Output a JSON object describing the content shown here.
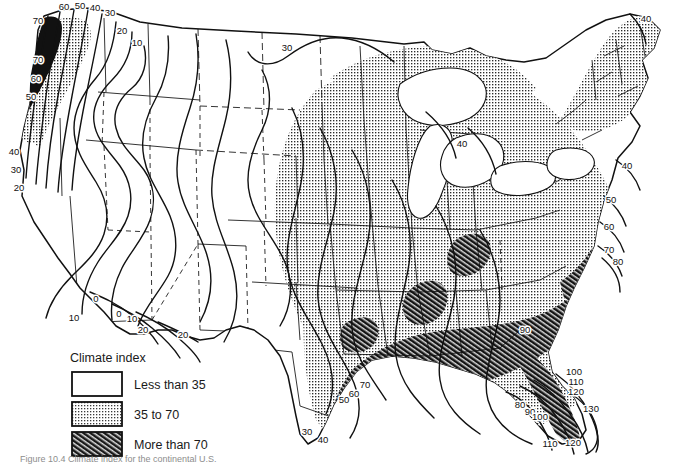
{
  "figure": {
    "kind": "contour-map",
    "region": "Contiguous United States",
    "background_color": "#ffffff",
    "line_color": "#111111",
    "caption": "Figure 10.4  Climate index for the continental U.S."
  },
  "legend": {
    "title": "Climate index",
    "items": [
      {
        "label": "Less than 35",
        "pattern": "blank",
        "swatch_name": "legend-swatch-blank"
      },
      {
        "label": "35 to 70",
        "pattern": "stipple",
        "swatch_name": "legend-swatch-stipple"
      },
      {
        "label": "More than 70",
        "pattern": "hatch",
        "swatch_name": "legend-swatch-hatch"
      }
    ]
  },
  "chart_data": {
    "type": "contour-map",
    "title": "Climate index",
    "units": "index",
    "classes": [
      {
        "name": "Less than 35",
        "range": [
          null,
          35
        ],
        "fill": "blank"
      },
      {
        "name": "35 to 70",
        "range": [
          35,
          70
        ],
        "fill": "stipple"
      },
      {
        "name": "More than 70",
        "range": [
          70,
          null
        ],
        "fill": "hatch"
      }
    ],
    "contour_interval": 10,
    "contour_levels": [
      0,
      10,
      20,
      30,
      40,
      50,
      60,
      70,
      80,
      90,
      100,
      110,
      120,
      130
    ],
    "contour_labels": [
      {
        "value": "70",
        "x": 38,
        "y": 24
      },
      {
        "value": "60",
        "x": 64,
        "y": 10
      },
      {
        "value": "50",
        "x": 80,
        "y": 9
      },
      {
        "value": "40",
        "x": 95,
        "y": 11
      },
      {
        "value": "30",
        "x": 110,
        "y": 16
      },
      {
        "value": "20",
        "x": 122,
        "y": 34
      },
      {
        "value": "10",
        "x": 137,
        "y": 46
      },
      {
        "value": "70",
        "x": 38,
        "y": 63
      },
      {
        "value": "60",
        "x": 36,
        "y": 82
      },
      {
        "value": "50",
        "x": 31,
        "y": 100
      },
      {
        "value": "40",
        "x": 14,
        "y": 155
      },
      {
        "value": "30",
        "x": 16,
        "y": 173
      },
      {
        "value": "20",
        "x": 19,
        "y": 191
      },
      {
        "value": "10",
        "x": 74,
        "y": 321
      },
      {
        "value": "0",
        "x": 96,
        "y": 302
      },
      {
        "value": "0",
        "x": 119,
        "y": 317
      },
      {
        "value": "10",
        "x": 132,
        "y": 322
      },
      {
        "value": "20",
        "x": 143,
        "y": 333
      },
      {
        "value": "20",
        "x": 183,
        "y": 338
      },
      {
        "value": "30",
        "x": 287,
        "y": 51
      },
      {
        "value": "30",
        "x": 307,
        "y": 435
      },
      {
        "value": "40",
        "x": 323,
        "y": 443
      },
      {
        "value": "50",
        "x": 344,
        "y": 403
      },
      {
        "value": "60",
        "x": 354,
        "y": 397
      },
      {
        "value": "70",
        "x": 365,
        "y": 388
      },
      {
        "value": "90",
        "x": 525,
        "y": 333
      },
      {
        "value": "80",
        "x": 520,
        "y": 408
      },
      {
        "value": "90",
        "x": 530,
        "y": 415
      },
      {
        "value": "100",
        "x": 540,
        "y": 420
      },
      {
        "value": "100",
        "x": 574,
        "y": 375
      },
      {
        "value": "110",
        "x": 576,
        "y": 385
      },
      {
        "value": "120",
        "x": 576,
        "y": 395
      },
      {
        "value": "130",
        "x": 591,
        "y": 412
      },
      {
        "value": "110",
        "x": 550,
        "y": 447
      },
      {
        "value": "120",
        "x": 573,
        "y": 446
      },
      {
        "value": "40",
        "x": 462,
        "y": 147
      },
      {
        "value": "40",
        "x": 646,
        "y": 22
      },
      {
        "value": "40",
        "x": 627,
        "y": 169
      },
      {
        "value": "50",
        "x": 611,
        "y": 203
      },
      {
        "value": "60",
        "x": 609,
        "y": 230
      },
      {
        "value": "70",
        "x": 609,
        "y": 253
      },
      {
        "value": "80",
        "x": 618,
        "y": 265
      }
    ]
  }
}
